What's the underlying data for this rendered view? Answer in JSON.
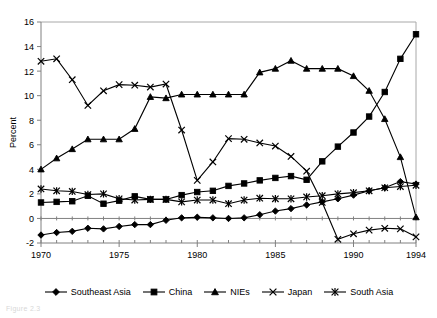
{
  "chart_data": {
    "type": "line",
    "title": "",
    "xlabel": "",
    "ylabel": "Percent",
    "xlim": [
      1970,
      1994
    ],
    "ylim": [
      -2,
      16
    ],
    "yticks": [
      -2,
      0,
      2,
      4,
      6,
      8,
      10,
      12,
      14,
      16
    ],
    "xticks": [
      1970,
      1975,
      1980,
      1985,
      1990,
      1994
    ],
    "xtick_labels": [
      "1970",
      "1975",
      "1980",
      "1985",
      "1990",
      "1994"
    ],
    "ytick_labels": [
      "-2",
      "0",
      "2",
      "4",
      "6",
      "8",
      "10",
      "12",
      "14",
      "16"
    ],
    "x": [
      1970,
      1971,
      1972,
      1973,
      1974,
      1975,
      1976,
      1977,
      1978,
      1979,
      1980,
      1981,
      1982,
      1983,
      1984,
      1985,
      1986,
      1987,
      1988,
      1989,
      1990,
      1991,
      1992,
      1993,
      1994
    ],
    "grid": false,
    "legend_position": "bottom",
    "series": [
      {
        "name": "Southeast Asia",
        "marker": "diamond",
        "values": [
          -1.35,
          -1.15,
          -1.05,
          -0.8,
          -0.85,
          -0.65,
          -0.5,
          -0.5,
          -0.15,
          0.05,
          0.1,
          0.05,
          0.0,
          0.05,
          0.3,
          0.6,
          0.8,
          1.1,
          1.35,
          1.6,
          1.9,
          2.25,
          2.5,
          3.0,
          2.8
        ]
      },
      {
        "name": "China",
        "marker": "square",
        "values": [
          1.3,
          1.35,
          1.4,
          1.85,
          1.2,
          1.45,
          1.8,
          1.55,
          1.55,
          1.9,
          2.15,
          2.25,
          2.65,
          2.85,
          3.1,
          3.3,
          3.45,
          3.15,
          4.65,
          5.85,
          7.0,
          8.3,
          10.3,
          13.0,
          15.0
        ]
      },
      {
        "name": "NIEs",
        "marker": "triangle",
        "values": [
          4.0,
          4.9,
          5.65,
          6.45,
          6.45,
          6.45,
          7.3,
          9.9,
          9.8,
          10.1,
          10.1,
          10.1,
          10.1,
          10.1,
          11.9,
          12.2,
          12.85,
          12.2,
          12.2,
          12.2,
          11.6,
          10.4,
          8.1,
          5.0,
          0.1
        ]
      },
      {
        "name": "Japan",
        "marker": "x",
        "values": [
          12.8,
          13.0,
          11.3,
          9.2,
          10.4,
          10.9,
          10.85,
          10.7,
          10.95,
          7.2,
          3.1,
          4.6,
          6.5,
          6.45,
          6.15,
          5.9,
          5.05,
          3.85,
          1.3,
          -1.7,
          -1.25,
          -0.95,
          -0.8,
          -0.85,
          -1.5
        ]
      },
      {
        "name": "South Asia",
        "marker": "star",
        "values": [
          2.4,
          2.25,
          2.2,
          1.95,
          2.0,
          1.6,
          1.5,
          1.55,
          1.55,
          1.35,
          1.5,
          1.5,
          1.2,
          1.5,
          1.65,
          1.6,
          1.6,
          1.75,
          1.85,
          2.0,
          2.1,
          2.25,
          2.5,
          2.6,
          2.7
        ]
      }
    ]
  },
  "legend": {
    "items": [
      {
        "label": "Southeast Asia",
        "marker": "diamond"
      },
      {
        "label": "China",
        "marker": "square"
      },
      {
        "label": "NIEs",
        "marker": "triangle"
      },
      {
        "label": "Japan",
        "marker": "x"
      },
      {
        "label": "South Asia",
        "marker": "star"
      }
    ]
  },
  "caption": "Figure 2.3"
}
